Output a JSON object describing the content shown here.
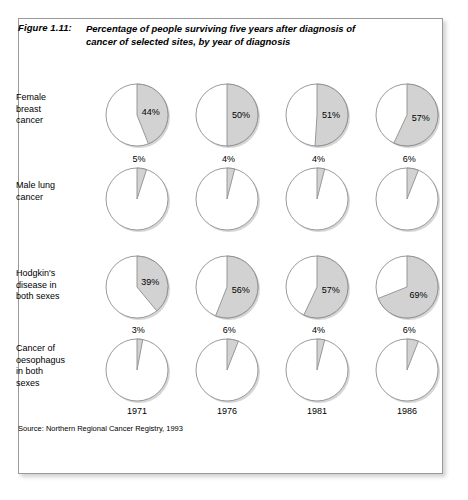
{
  "figure": {
    "number": "Figure 1.11:",
    "caption_line1": "Percentage of people surviving five years after diagnosis of",
    "caption_line2": "cancer of selected sites, by year of diagnosis",
    "source": "Source: Northern Regional Cancer Registry, 1993",
    "accent_fill": "#d2d2d2",
    "outline": "#8e8e8e"
  },
  "chart_data": {
    "type": "pie",
    "title": "Percentage of people surviving five years after diagnosis of cancer of selected sites, by year of diagnosis",
    "xlabel": "",
    "ylabel": "",
    "categories": [
      "1971",
      "1976",
      "1981",
      "1986"
    ],
    "legend": [],
    "units": "%",
    "note": "Each pie shows the percentage surviving five years (shaded wedge, drawn clockwise from 12 o'clock) against the remainder (unshaded).",
    "series": [
      {
        "name": "Female breast cancer",
        "label_lines": [
          "Female",
          "breast",
          "cancer"
        ],
        "values": [
          44,
          50,
          51,
          57
        ],
        "value_labels": [
          "44%",
          "50%",
          "51%",
          "57%"
        ],
        "label_position": "inside"
      },
      {
        "name": "Male lung cancer",
        "label_lines": [
          "Male lung",
          "cancer"
        ],
        "values": [
          5,
          4,
          4,
          6
        ],
        "value_labels": [
          "5%",
          "4%",
          "4%",
          "6%"
        ],
        "label_position": "above"
      },
      {
        "name": "Hodgkin's disease in both sexes",
        "label_lines": [
          "Hodgkin's",
          "disease in",
          "both sexes"
        ],
        "values": [
          39,
          56,
          57,
          69
        ],
        "value_labels": [
          "39%",
          "56%",
          "57%",
          "69%"
        ],
        "label_position": "inside"
      },
      {
        "name": "Cancer of oesophagus in both sexes",
        "label_lines": [
          "Cancer of",
          "oesophagus",
          "in both",
          "sexes"
        ],
        "values": [
          3,
          6,
          4,
          6
        ],
        "value_labels": [
          "3%",
          "6%",
          "4%",
          "6%"
        ],
        "label_position": "above"
      }
    ],
    "tick_labels": [
      "1971",
      "1976",
      "1981",
      "1986"
    ],
    "grid": false,
    "legend_position": "none"
  }
}
